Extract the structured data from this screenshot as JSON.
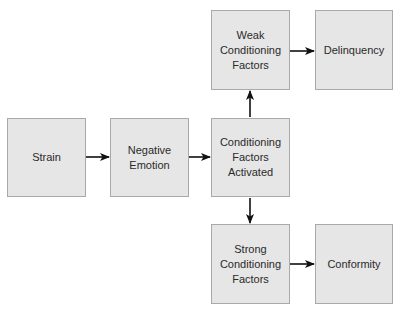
{
  "diagram": {
    "type": "flowchart",
    "nodes": [
      {
        "id": "strain",
        "label": "Strain"
      },
      {
        "id": "negative_emotion",
        "label": "Negative\nEmotion"
      },
      {
        "id": "conditioning_activated",
        "label": "Conditioning\nFactors\nActivated"
      },
      {
        "id": "weak_conditioning",
        "label": "Weak\nConditioning\nFactors"
      },
      {
        "id": "delinquency",
        "label": "Delinquency"
      },
      {
        "id": "strong_conditioning",
        "label": "Strong\nConditioning\nFactors"
      },
      {
        "id": "conformity",
        "label": "Conformity"
      }
    ],
    "edges": [
      {
        "from": "strain",
        "to": "negative_emotion"
      },
      {
        "from": "negative_emotion",
        "to": "conditioning_activated"
      },
      {
        "from": "conditioning_activated",
        "to": "weak_conditioning"
      },
      {
        "from": "conditioning_activated",
        "to": "strong_conditioning"
      },
      {
        "from": "weak_conditioning",
        "to": "delinquency"
      },
      {
        "from": "strong_conditioning",
        "to": "conformity"
      }
    ],
    "colors": {
      "box_fill": "#e6e6e6",
      "box_border": "#a9a9a9",
      "arrow": "#111111",
      "text": "#2a2a2a"
    }
  }
}
